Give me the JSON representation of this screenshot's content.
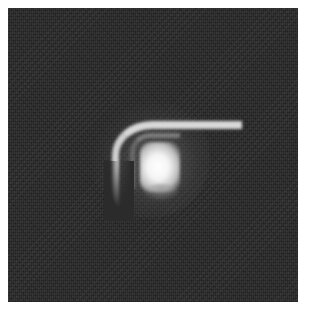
{
  "image": {
    "description": "Grayscale noisy dark square with a bright central blob and an arc-shaped bright streak above-left of it",
    "colors": {
      "page_background": "#ffffff",
      "frame_background": "#2b2b2b",
      "core": "#ffffff",
      "arc": "#d8d8d8"
    },
    "frame_bounds": {
      "left": 8,
      "top": 8,
      "right": 298,
      "bottom": 302
    }
  }
}
